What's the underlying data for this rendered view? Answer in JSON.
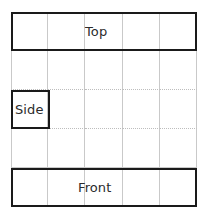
{
  "figure": {
    "name": "orthographic-projection-grid",
    "width": 205,
    "height": 212,
    "background_color": "#ffffff"
  },
  "grid": {
    "columns": 5,
    "rows": 5,
    "line_color": "#c9c9c9",
    "dotted_line_color": "#bdbdbd",
    "left": 11,
    "top": 12,
    "cell_width": 37,
    "cell_height": 39
  },
  "regions": [
    {
      "id": "top",
      "label": "Top",
      "shape": "band",
      "span": "row-1-all-columns",
      "border_color": "#1a1a1a",
      "border_width": 2.5
    },
    {
      "id": "side",
      "label": "Side",
      "shape": "cell",
      "span": "row-3-column-1",
      "border_color": "#1a1a1a",
      "border_width": 2.5
    },
    {
      "id": "front",
      "label": "Front",
      "shape": "band",
      "span": "row-5-all-columns",
      "border_color": "#1a1a1a",
      "border_width": 2.5
    }
  ],
  "labels": {
    "top": "Top",
    "side": "Side",
    "front": "Front",
    "text_color": "#2b2b2b"
  }
}
